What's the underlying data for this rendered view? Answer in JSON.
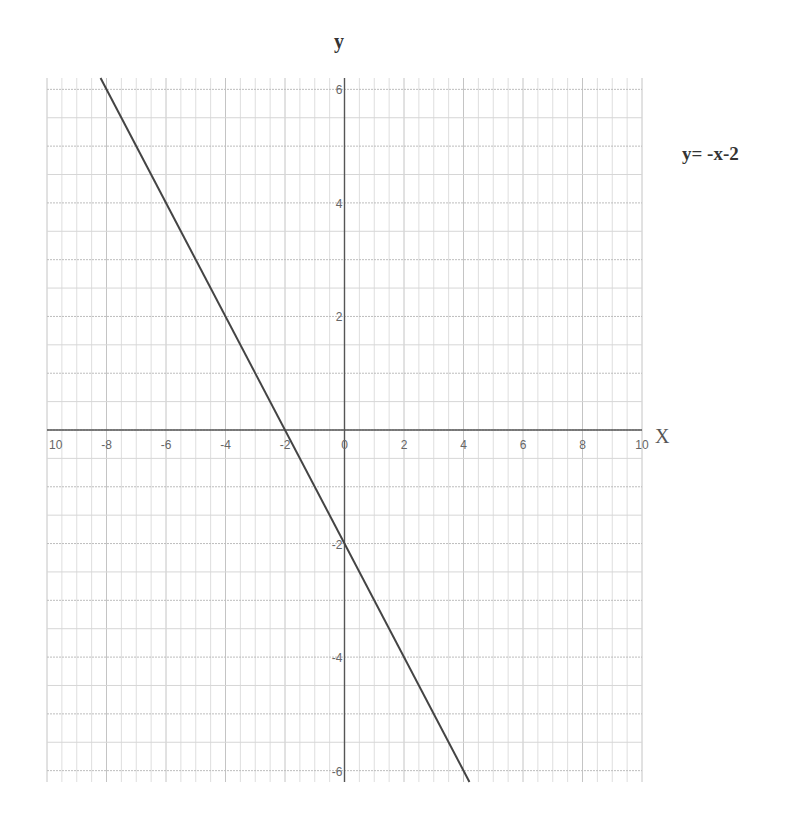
{
  "chart_data": {
    "type": "line",
    "title": "",
    "xlabel": "X",
    "ylabel": "y",
    "annotation": "y= -x-2",
    "xlim": [
      -10,
      10
    ],
    "ylim": [
      -6.2,
      6.2
    ],
    "grid": true,
    "x_ticks": [
      -10,
      -8,
      -6,
      -4,
      -2,
      0,
      2,
      4,
      6,
      8,
      10
    ],
    "x_tick_labels": [
      "10",
      "-8",
      "-6",
      "-4",
      "-2",
      "0",
      "2",
      "4",
      "6",
      "8",
      "10"
    ],
    "y_ticks": [
      6,
      4,
      2,
      -2,
      -4,
      -6
    ],
    "y_tick_labels": [
      "6",
      "4",
      "2",
      "-2",
      "-4",
      "-6"
    ],
    "series": [
      {
        "name": "y = -x - 2",
        "color": "#444444",
        "x": [
          -8.2,
          4.2
        ],
        "y": [
          6.2,
          -6.2
        ]
      }
    ]
  },
  "labels": {
    "y_axis": "y",
    "x_axis": "X",
    "equation": "y= -x-2"
  }
}
